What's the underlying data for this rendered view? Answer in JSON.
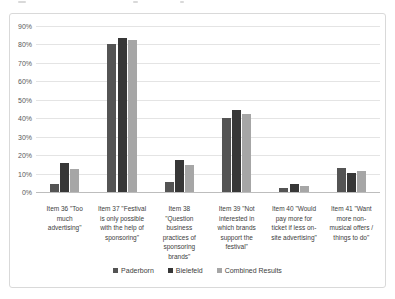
{
  "chart_data": {
    "type": "bar",
    "title": "",
    "xlabel": "",
    "ylabel": "",
    "ylim": [
      0,
      90
    ],
    "ytick_step": 10,
    "ytick_suffix": "%",
    "grid": true,
    "legend_position": "bottom",
    "categories": [
      "Item 36 \"Too much advertising\"",
      "Item 37 \"Festival is only possible with the help of sponsoring\"",
      "Item 38 \"Question business practices of sponsoring brands\"",
      "Item 39 \"Not interested in which brands support the festival\"",
      "Item 40 \"Would pay more for ticket if less on-site advertising\"",
      "Item 41 \"Want more non-musical offers / things to do\""
    ],
    "series": [
      {
        "name": "Paderborn",
        "color": "#545454",
        "values": [
          4.5,
          80.0,
          5.5,
          40.0,
          2.0,
          13.0
        ]
      },
      {
        "name": "Bielefeld",
        "color": "#373737",
        "values": [
          15.5,
          83.5,
          17.5,
          44.5,
          4.5,
          10.5
        ]
      },
      {
        "name": "Combined Results",
        "color": "#a6a6a6",
        "values": [
          12.5,
          82.5,
          14.5,
          42.5,
          3.5,
          11.5
        ]
      }
    ]
  }
}
